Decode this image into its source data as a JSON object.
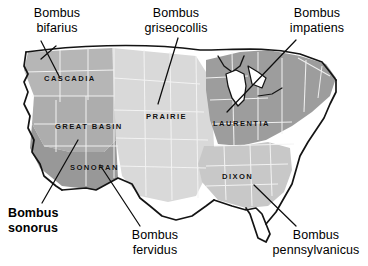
{
  "figure": {
    "background_color": "#ffffff",
    "text_color": "#000000"
  },
  "map": {
    "name": "contiguous-united-states",
    "outline_color": "#111111",
    "state_border_color": "#f2f2f2",
    "regions": [
      {
        "id": "cascadia",
        "label": "CASCADIA",
        "fill": "#b4b4b4",
        "label_x": 44,
        "label_y": 74
      },
      {
        "id": "great-basin",
        "label": "GREAT BASIN",
        "fill": "#b0b0b0",
        "label_x": 55,
        "label_y": 122
      },
      {
        "id": "sonoran",
        "label": "SONORAN",
        "fill": "#9a9a9a",
        "label_x": 70,
        "label_y": 163
      },
      {
        "id": "prairie",
        "label": "PRAIRIE",
        "fill": "#d8d8d8",
        "label_x": 146,
        "label_y": 112
      },
      {
        "id": "laurentia",
        "label": "LAURENTIA",
        "fill": "#9e9e9e",
        "label_x": 213,
        "label_y": 119
      },
      {
        "id": "dixon",
        "label": "DIXON",
        "fill": "#c6c6c6",
        "label_x": 222,
        "label_y": 172
      }
    ]
  },
  "species": [
    {
      "id": "bombus-bifarius",
      "label": "Bombus\nbifarius",
      "weight": "regular",
      "align": "center",
      "x": 14,
      "y": 6,
      "leader": {
        "from_x": 56,
        "from_y": 46,
        "to_x": 41,
        "to_y": 59
      }
    },
    {
      "id": "bombus-griseocollis",
      "label": "Bombus\ngriseocollis",
      "weight": "regular",
      "align": "center",
      "x": 128,
      "y": 6,
      "leader": {
        "from_x": 178,
        "from_y": 38,
        "to_x": 158,
        "to_y": 104
      }
    },
    {
      "id": "bombus-impatiens",
      "label": "Bombus\nimpatiens",
      "weight": "regular",
      "align": "center",
      "x": 274,
      "y": 6,
      "leader": {
        "from_x": 296,
        "from_y": 40,
        "to_x": 227,
        "to_y": 112
      }
    },
    {
      "id": "bombus-sonorus",
      "label": "Bombus\nsonorus",
      "weight": "bold",
      "align": "left",
      "x": 8,
      "y": 206,
      "leader": {
        "from_x": 42,
        "from_y": 203,
        "to_x": 78,
        "to_y": 140
      }
    },
    {
      "id": "bombus-fervidus",
      "label": "Bombus\nfervidus",
      "weight": "regular",
      "align": "center",
      "x": 112,
      "y": 228,
      "leader": {
        "from_x": 140,
        "from_y": 226,
        "to_x": 100,
        "to_y": 165
      }
    },
    {
      "id": "bombus-pennsylvanicus",
      "label": "Bombus\npennsylvanicus",
      "weight": "regular",
      "align": "center",
      "x": 272,
      "y": 228,
      "leader": {
        "from_x": 296,
        "from_y": 226,
        "to_x": 254,
        "to_y": 185
      }
    }
  ]
}
